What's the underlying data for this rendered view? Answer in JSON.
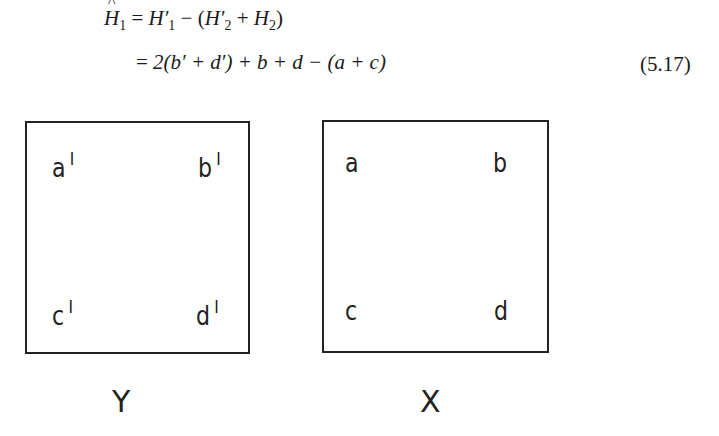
{
  "equation": {
    "line1": {
      "lhs_symbol": "H",
      "lhs_sub": "1",
      "eq": "=",
      "term1": "H′",
      "term1_sub": "1",
      "minus": "−",
      "open": "(",
      "term2": "H′",
      "term2_sub": "2",
      "plus": "+",
      "term3": "H",
      "term3_sub": "2",
      "close": ")"
    },
    "line2": {
      "eq": "=",
      "text": "2(b′ + d′) + b + d − (a + c)"
    },
    "number": "(5.17)"
  },
  "figure": {
    "box_y": {
      "caption": "Y",
      "top_left": "a",
      "top_right": "b",
      "bottom_left": "c",
      "bottom_right": "d",
      "prime": "I"
    },
    "box_x": {
      "caption": "X",
      "top_left": "a",
      "top_right": "b",
      "bottom_left": "c",
      "bottom_right": "d"
    }
  }
}
